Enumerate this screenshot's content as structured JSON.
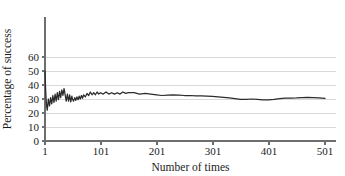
{
  "figure": {
    "width": 345,
    "height": 176,
    "background": "#ffffff"
  },
  "axis_titles": {
    "x": "Number of times",
    "y": "Percentage of success"
  },
  "y_ticks": [
    "0",
    "10",
    "20",
    "30",
    "40",
    "50",
    "60"
  ],
  "x_ticks": [
    "1",
    "101",
    "201",
    "301",
    "401",
    "501"
  ],
  "colors": {
    "line": "#2b2b2b",
    "grid": "#d9d9d9",
    "axis": "#6e6e6e",
    "text": "#1b1b1b"
  },
  "chart_data": {
    "type": "line",
    "title": "",
    "xlabel": "Number of times",
    "ylabel": "Percentage of success",
    "xlim": [
      1,
      521
    ],
    "ylim": [
      0,
      66
    ],
    "xticks": [
      1,
      101,
      201,
      301,
      401,
      501
    ],
    "yticks": [
      0,
      10,
      20,
      30,
      40,
      50,
      60
    ],
    "grid": "horizontal",
    "legend": "none",
    "series": [
      {
        "name": "Percentage of success",
        "x": [
          1,
          2,
          3,
          4,
          5,
          6,
          7,
          8,
          9,
          10,
          11,
          12,
          13,
          14,
          15,
          16,
          17,
          18,
          19,
          20,
          21,
          22,
          23,
          24,
          25,
          26,
          27,
          28,
          29,
          30,
          31,
          32,
          33,
          34,
          35,
          36,
          37,
          38,
          39,
          40,
          41,
          42,
          43,
          44,
          45,
          46,
          47,
          48,
          49,
          50,
          52,
          54,
          56,
          58,
          60,
          62,
          64,
          66,
          68,
          70,
          73,
          76,
          79,
          82,
          85,
          88,
          91,
          94,
          97,
          100,
          105,
          110,
          115,
          120,
          125,
          130,
          135,
          140,
          145,
          150,
          160,
          170,
          180,
          190,
          200,
          210,
          220,
          230,
          240,
          250,
          260,
          270,
          280,
          290,
          300,
          310,
          320,
          330,
          340,
          350,
          360,
          370,
          380,
          390,
          400,
          410,
          420,
          430,
          440,
          450,
          460,
          470,
          480,
          490,
          501
        ],
        "y": [
          50.0,
          38.0,
          30.0,
          24.5,
          22.0,
          26.0,
          30.0,
          27.5,
          25.0,
          28.0,
          31.0,
          28.5,
          26.5,
          29.5,
          32.5,
          30.0,
          27.5,
          30.5,
          33.5,
          31.0,
          28.5,
          31.5,
          34.5,
          32.0,
          29.5,
          32.5,
          35.5,
          33.0,
          31.0,
          34.0,
          36.5,
          34.5,
          32.5,
          35.0,
          37.5,
          35.5,
          33.0,
          30.5,
          28.5,
          31.0,
          33.5,
          31.0,
          28.5,
          30.5,
          33.0,
          30.5,
          28.0,
          30.0,
          32.0,
          30.0,
          28.5,
          31.0,
          29.0,
          31.5,
          29.5,
          32.0,
          30.0,
          32.5,
          30.5,
          33.0,
          31.5,
          34.0,
          32.5,
          35.0,
          33.0,
          34.5,
          33.0,
          35.0,
          33.5,
          34.5,
          33.5,
          35.0,
          33.5,
          34.5,
          33.5,
          34.5,
          33.5,
          35.0,
          34.0,
          34.5,
          34.5,
          33.5,
          34.0,
          33.5,
          33.0,
          32.5,
          32.8,
          33.0,
          32.8,
          32.5,
          32.5,
          32.3,
          32.2,
          32.0,
          31.8,
          31.5,
          31.2,
          30.8,
          30.3,
          29.8,
          29.8,
          30.0,
          29.8,
          29.4,
          29.4,
          29.8,
          30.3,
          30.6,
          30.7,
          30.8,
          31.0,
          31.1,
          31.0,
          30.8,
          30.4
        ]
      }
    ]
  }
}
